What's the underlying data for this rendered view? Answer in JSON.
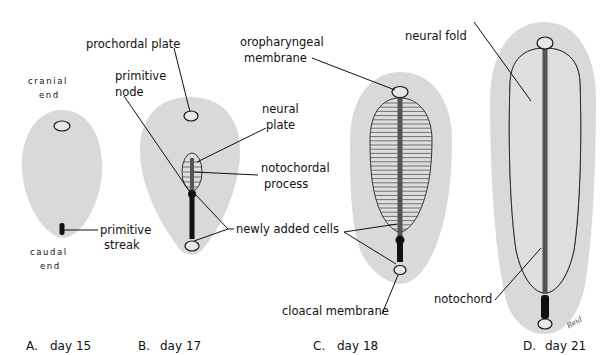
{
  "figure": {
    "panels": [
      {
        "id": "A",
        "letter": "A.",
        "caption": "day 15"
      },
      {
        "id": "B",
        "letter": "B.",
        "caption": "day 17"
      },
      {
        "id": "C",
        "letter": "C.",
        "caption": "day 18"
      },
      {
        "id": "D",
        "letter": "D.",
        "caption": "day 21"
      }
    ],
    "labels": {
      "cranial_end": [
        "cranial",
        "end"
      ],
      "caudal_end": [
        "caudal",
        "end"
      ],
      "primitive_streak": [
        "primitive",
        "streak"
      ],
      "prochordal_plate": "prochordal plate",
      "primitive_node": [
        "primitive",
        "node"
      ],
      "neural_plate": [
        "neural",
        "plate"
      ],
      "notochordal_process": [
        "notochordal",
        "process"
      ],
      "newly_added_cells": "newly added cells",
      "oropharyngeal_membrane": [
        "oropharyngeal",
        "membrane"
      ],
      "cloacal_membrane": "cloacal membrane",
      "neural_fold": "neural fold",
      "notochord": "notochord"
    },
    "signature": "Reid"
  }
}
